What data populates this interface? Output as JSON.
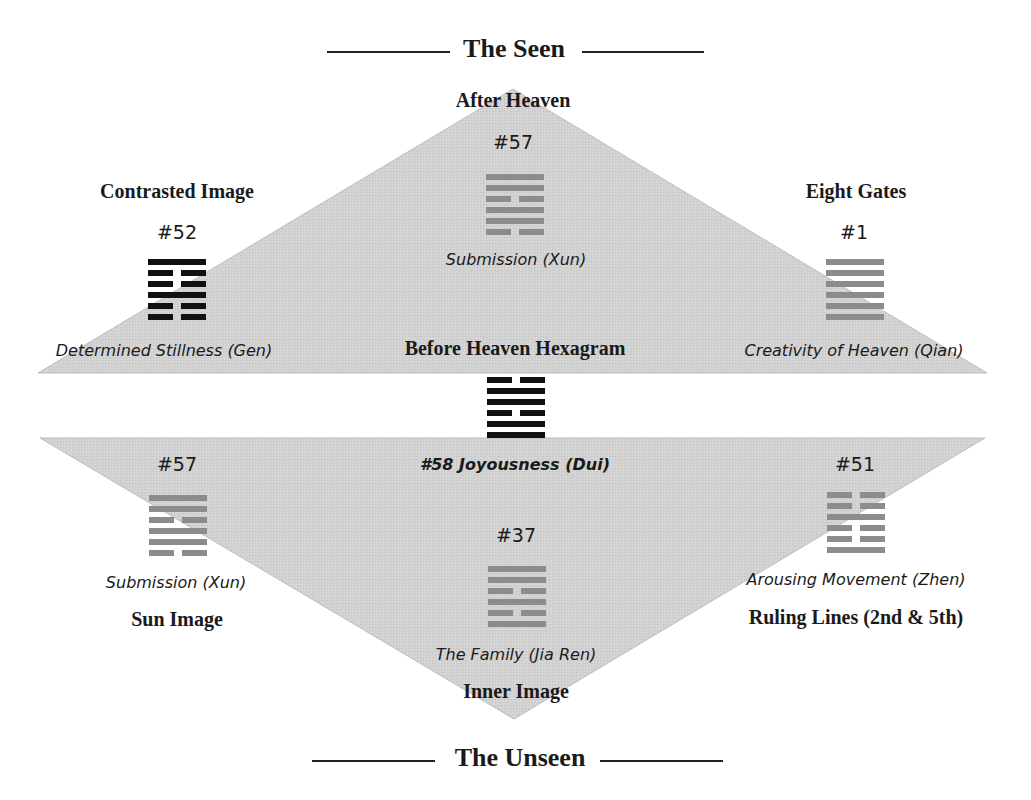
{
  "header": {
    "title": "The Seen"
  },
  "footer": {
    "title": "The Unseen"
  },
  "upper_triangle": {
    "label": "After Heaven",
    "fill": "#cfcfcf",
    "apex": [
      513,
      89
    ],
    "base_left": [
      38,
      373
    ],
    "base_right": [
      987,
      373
    ]
  },
  "lower_triangle": {
    "label": "Inner Image",
    "fill": "#cfcfcf",
    "apex": [
      514,
      719
    ],
    "top_left": [
      40,
      438
    ],
    "top_right": [
      985,
      438
    ]
  },
  "center": {
    "label": "Before Heaven Hexagram",
    "caption": "#58 Joyousness (Dui)"
  },
  "hexagrams": [
    {
      "id": "after-heaven",
      "number": "#57",
      "name": "Submission (Xun)",
      "role": "",
      "color": "#8c8c8c",
      "lines": [
        "solid",
        "solid",
        "broken",
        "solid",
        "solid",
        "broken"
      ]
    },
    {
      "id": "contrasted",
      "number": "#52",
      "name": "Determined Stillness (Gen)",
      "role": "Contrasted Image",
      "color": "#111111",
      "lines": [
        "solid",
        "broken",
        "broken",
        "solid",
        "broken",
        "broken"
      ]
    },
    {
      "id": "eight-gates",
      "number": "#1",
      "name": "Creativity of Heaven (Qian)",
      "role": "Eight Gates",
      "color": "#8c8c8c",
      "lines": [
        "solid",
        "solid",
        "solid",
        "solid",
        "solid",
        "solid"
      ]
    },
    {
      "id": "before-heaven",
      "number": "#58",
      "name": "Joyousness (Dui)",
      "role": "Before Heaven Hexagram",
      "color": "#111111",
      "lines": [
        "broken",
        "solid",
        "solid",
        "broken",
        "solid",
        "solid"
      ]
    },
    {
      "id": "sun-image",
      "number": "#57",
      "name": "Submission (Xun)",
      "role": "Sun Image",
      "color": "#8c8c8c",
      "lines": [
        "solid",
        "solid",
        "broken",
        "solid",
        "solid",
        "broken"
      ]
    },
    {
      "id": "ruling-lines",
      "number": "#51",
      "name": "Arousing Movement (Zhen)",
      "role": "Ruling Lines (2nd & 5th)",
      "color": "#8c8c8c",
      "lines": [
        "broken",
        "broken",
        "solid",
        "broken",
        "broken",
        "solid"
      ]
    },
    {
      "id": "inner-image",
      "number": "#37",
      "name": "The Family (Jia Ren)",
      "role": "Inner Image",
      "color": "#8c8c8c",
      "lines": [
        "solid",
        "solid",
        "broken",
        "solid",
        "broken",
        "solid"
      ]
    }
  ]
}
